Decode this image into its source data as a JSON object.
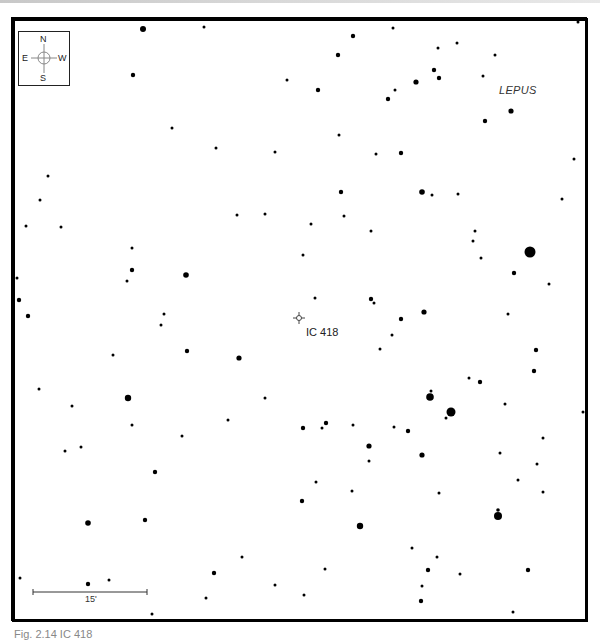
{
  "figure": {
    "caption": "Fig. 2.14 IC 418",
    "constellation": "LEPUS",
    "target": {
      "label": "IC 418",
      "x": 299,
      "y": 318
    },
    "scale_bar": {
      "label": "15'",
      "x1": 33,
      "x2": 147,
      "y": 592
    },
    "compass": {
      "n": "N",
      "s": "S",
      "e": "E",
      "w": "W"
    },
    "frame": {
      "left": 12,
      "top": 18,
      "right": 588,
      "bottom": 622
    },
    "colors": {
      "stars": "#000000",
      "frame": "#000000",
      "caption": "#888888",
      "target": "#444444"
    }
  },
  "chart_data": {
    "type": "scatter",
    "xlabel": "",
    "ylabel": "",
    "grid": false,
    "note": "Star positions in pixel coords; r = marker radius (brightness)",
    "stars": [
      {
        "x": 143,
        "y": 29,
        "r": 3
      },
      {
        "x": 204,
        "y": 27,
        "r": 1.5
      },
      {
        "x": 133,
        "y": 75,
        "r": 2.2
      },
      {
        "x": 287,
        "y": 80,
        "r": 1.5
      },
      {
        "x": 172,
        "y": 128,
        "r": 1.5
      },
      {
        "x": 216,
        "y": 148,
        "r": 1.5
      },
      {
        "x": 275,
        "y": 152,
        "r": 1.5
      },
      {
        "x": 393,
        "y": 28,
        "r": 1.5
      },
      {
        "x": 353,
        "y": 36,
        "r": 2.2
      },
      {
        "x": 338,
        "y": 55,
        "r": 2.2
      },
      {
        "x": 438,
        "y": 48,
        "r": 1.5
      },
      {
        "x": 457,
        "y": 43,
        "r": 1.5
      },
      {
        "x": 495,
        "y": 55,
        "r": 1.5
      },
      {
        "x": 434,
        "y": 70,
        "r": 2.2
      },
      {
        "x": 439,
        "y": 78,
        "r": 2.2
      },
      {
        "x": 416,
        "y": 82,
        "r": 2.6
      },
      {
        "x": 395,
        "y": 90,
        "r": 1.5
      },
      {
        "x": 388,
        "y": 99,
        "r": 2.2
      },
      {
        "x": 483,
        "y": 76,
        "r": 1.5
      },
      {
        "x": 318,
        "y": 90,
        "r": 2.2
      },
      {
        "x": 511,
        "y": 111,
        "r": 2.6
      },
      {
        "x": 485,
        "y": 121,
        "r": 2.2
      },
      {
        "x": 339,
        "y": 135,
        "r": 1.5
      },
      {
        "x": 376,
        "y": 154,
        "r": 1.5
      },
      {
        "x": 401,
        "y": 153,
        "r": 2.2
      },
      {
        "x": 574,
        "y": 159,
        "r": 1.5
      },
      {
        "x": 578,
        "y": 22,
        "r": 1.5
      },
      {
        "x": 48,
        "y": 176,
        "r": 1.5
      },
      {
        "x": 40,
        "y": 200,
        "r": 1.5
      },
      {
        "x": 61,
        "y": 227,
        "r": 1.5
      },
      {
        "x": 26,
        "y": 226,
        "r": 1.5
      },
      {
        "x": 132,
        "y": 248,
        "r": 1.5
      },
      {
        "x": 237,
        "y": 215,
        "r": 1.5
      },
      {
        "x": 265,
        "y": 214,
        "r": 1.5
      },
      {
        "x": 132,
        "y": 270,
        "r": 2.2
      },
      {
        "x": 127,
        "y": 281,
        "r": 1.5
      },
      {
        "x": 186,
        "y": 275,
        "r": 2.8
      },
      {
        "x": 17,
        "y": 278,
        "r": 1.5
      },
      {
        "x": 19,
        "y": 300,
        "r": 2.2
      },
      {
        "x": 303,
        "y": 255,
        "r": 1.5
      },
      {
        "x": 341,
        "y": 192,
        "r": 2.2
      },
      {
        "x": 422,
        "y": 192,
        "r": 2.8
      },
      {
        "x": 432,
        "y": 195,
        "r": 1.5
      },
      {
        "x": 458,
        "y": 194,
        "r": 1.5
      },
      {
        "x": 562,
        "y": 199,
        "r": 1.5
      },
      {
        "x": 311,
        "y": 224,
        "r": 1.5
      },
      {
        "x": 344,
        "y": 216,
        "r": 1.5
      },
      {
        "x": 371,
        "y": 231,
        "r": 1.5
      },
      {
        "x": 475,
        "y": 231,
        "r": 1.5
      },
      {
        "x": 473,
        "y": 241,
        "r": 1.5
      },
      {
        "x": 481,
        "y": 258,
        "r": 1.5
      },
      {
        "x": 530,
        "y": 252,
        "r": 5.5
      },
      {
        "x": 514,
        "y": 273,
        "r": 2.2
      },
      {
        "x": 549,
        "y": 284,
        "r": 1.5
      },
      {
        "x": 315,
        "y": 298,
        "r": 1.5
      },
      {
        "x": 371,
        "y": 299,
        "r": 2.2
      },
      {
        "x": 374,
        "y": 303,
        "r": 1.5
      },
      {
        "x": 28,
        "y": 316,
        "r": 2.2
      },
      {
        "x": 164,
        "y": 314,
        "r": 1.5
      },
      {
        "x": 161,
        "y": 325,
        "r": 1.5
      },
      {
        "x": 113,
        "y": 355,
        "r": 1.5
      },
      {
        "x": 187,
        "y": 351,
        "r": 2.2
      },
      {
        "x": 239,
        "y": 358,
        "r": 2.6
      },
      {
        "x": 39,
        "y": 389,
        "r": 1.5
      },
      {
        "x": 128,
        "y": 398,
        "r": 3.2
      },
      {
        "x": 72,
        "y": 406,
        "r": 1.5
      },
      {
        "x": 132,
        "y": 425,
        "r": 1.5
      },
      {
        "x": 228,
        "y": 420,
        "r": 1.5
      },
      {
        "x": 265,
        "y": 398,
        "r": 1.5
      },
      {
        "x": 182,
        "y": 436,
        "r": 1.5
      },
      {
        "x": 65,
        "y": 451,
        "r": 1.5
      },
      {
        "x": 81,
        "y": 447,
        "r": 1.5
      },
      {
        "x": 303,
        "y": 428,
        "r": 2.2
      },
      {
        "x": 401,
        "y": 319,
        "r": 2.2
      },
      {
        "x": 424,
        "y": 312,
        "r": 2.6
      },
      {
        "x": 392,
        "y": 335,
        "r": 1.5
      },
      {
        "x": 380,
        "y": 349,
        "r": 1.5
      },
      {
        "x": 508,
        "y": 314,
        "r": 1.5
      },
      {
        "x": 536,
        "y": 350,
        "r": 2.2
      },
      {
        "x": 534,
        "y": 371,
        "r": 2.2
      },
      {
        "x": 469,
        "y": 378,
        "r": 1.5
      },
      {
        "x": 480,
        "y": 382,
        "r": 2.2
      },
      {
        "x": 430,
        "y": 397,
        "r": 3.8
      },
      {
        "x": 431,
        "y": 391,
        "r": 1.5
      },
      {
        "x": 451,
        "y": 412,
        "r": 4.5
      },
      {
        "x": 446,
        "y": 418,
        "r": 1.5
      },
      {
        "x": 505,
        "y": 404,
        "r": 1.5
      },
      {
        "x": 583,
        "y": 412,
        "r": 1.5
      },
      {
        "x": 322,
        "y": 428,
        "r": 1.5
      },
      {
        "x": 326,
        "y": 423,
        "r": 2.2
      },
      {
        "x": 353,
        "y": 425,
        "r": 1.5
      },
      {
        "x": 394,
        "y": 427,
        "r": 1.5
      },
      {
        "x": 408,
        "y": 431,
        "r": 2.2
      },
      {
        "x": 369,
        "y": 446,
        "r": 2.6
      },
      {
        "x": 543,
        "y": 438,
        "r": 1.5
      },
      {
        "x": 155,
        "y": 472,
        "r": 2.2
      },
      {
        "x": 302,
        "y": 501,
        "r": 2.2
      },
      {
        "x": 88,
        "y": 523,
        "r": 2.8
      },
      {
        "x": 145,
        "y": 520,
        "r": 2.2
      },
      {
        "x": 20,
        "y": 578,
        "r": 1.5
      },
      {
        "x": 109,
        "y": 580,
        "r": 1.5
      },
      {
        "x": 88,
        "y": 584,
        "r": 2.2
      },
      {
        "x": 214,
        "y": 573,
        "r": 2.2
      },
      {
        "x": 242,
        "y": 557,
        "r": 1.5
      },
      {
        "x": 206,
        "y": 598,
        "r": 1.5
      },
      {
        "x": 275,
        "y": 585,
        "r": 1.5
      },
      {
        "x": 152,
        "y": 614,
        "r": 1.5
      },
      {
        "x": 304,
        "y": 595,
        "r": 1.5
      },
      {
        "x": 422,
        "y": 455,
        "r": 2.6
      },
      {
        "x": 369,
        "y": 461,
        "r": 1.5
      },
      {
        "x": 500,
        "y": 453,
        "r": 1.5
      },
      {
        "x": 537,
        "y": 464,
        "r": 1.5
      },
      {
        "x": 316,
        "y": 482,
        "r": 1.5
      },
      {
        "x": 352,
        "y": 491,
        "r": 1.5
      },
      {
        "x": 439,
        "y": 493,
        "r": 1.5
      },
      {
        "x": 518,
        "y": 480,
        "r": 1.5
      },
      {
        "x": 543,
        "y": 492,
        "r": 1.5
      },
      {
        "x": 498,
        "y": 516,
        "r": 4
      },
      {
        "x": 498,
        "y": 510,
        "r": 1.8
      },
      {
        "x": 360,
        "y": 526,
        "r": 3.2
      },
      {
        "x": 412,
        "y": 548,
        "r": 1.5
      },
      {
        "x": 437,
        "y": 557,
        "r": 1.5
      },
      {
        "x": 325,
        "y": 569,
        "r": 1.5
      },
      {
        "x": 428,
        "y": 570,
        "r": 2.2
      },
      {
        "x": 460,
        "y": 574,
        "r": 1.5
      },
      {
        "x": 528,
        "y": 570,
        "r": 2.2
      },
      {
        "x": 422,
        "y": 586,
        "r": 1.5
      },
      {
        "x": 421,
        "y": 601,
        "r": 2.2
      },
      {
        "x": 513,
        "y": 612,
        "r": 1.5
      }
    ]
  }
}
